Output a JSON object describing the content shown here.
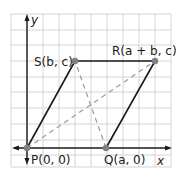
{
  "figure": {
    "type": "coordinate-geometry",
    "axes": {
      "x_label": "x",
      "y_label": "y"
    },
    "grid": {
      "columns": 10,
      "rows": 10,
      "color": "#d4d4d4"
    },
    "colors": {
      "axis": "#1a1a1a",
      "sides": "#1a1a1a",
      "diagonals": "#9a9a9a",
      "points": "#808080"
    },
    "points": [
      {
        "id": "P",
        "label": "P(0, 0)"
      },
      {
        "id": "Q",
        "label": "Q(a, 0)"
      },
      {
        "id": "R",
        "label": "R(a + b, c)"
      },
      {
        "id": "S",
        "label": "S(b, c)"
      }
    ],
    "sides": [
      "PQ",
      "QR",
      "RS",
      "SP"
    ],
    "diagonals": [
      "PR",
      "QS"
    ]
  }
}
